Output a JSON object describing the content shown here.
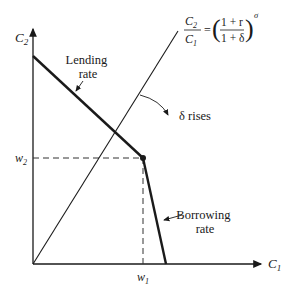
{
  "diagram": {
    "axes": {
      "x_label": "C",
      "x_label_sub": "1",
      "y_label": "C",
      "y_label_sub": "2"
    },
    "ticks": {
      "w1": "w",
      "w1_sub": "1",
      "w2": "w",
      "w2_sub": "2"
    },
    "labels": {
      "lending_line1": "Lending",
      "lending_line2": "rate",
      "borrowing_line1": "Borrowing",
      "borrowing_line2": "rate",
      "delta_rises": "δ rises"
    },
    "equation": {
      "lhs_num": "C",
      "lhs_num_sub": "2",
      "lhs_den": "C",
      "lhs_den_sub": "1",
      "equals": "=",
      "rhs_num": "1 + r",
      "rhs_den": "1 + δ",
      "exponent": "σ"
    },
    "colors": {
      "line": "#1a1a1a",
      "background": "#ffffff"
    }
  }
}
